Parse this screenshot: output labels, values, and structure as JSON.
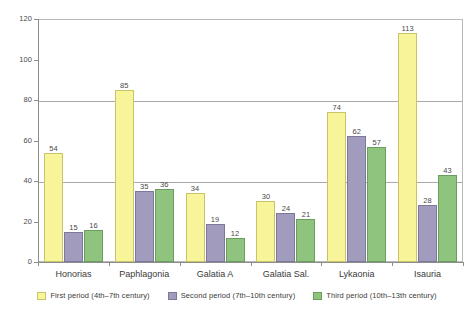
{
  "chart_data": {
    "type": "bar",
    "title": "",
    "subtitle": "",
    "xlabel": "",
    "ylabel": "",
    "ylim": [
      0,
      120
    ],
    "y_ticks": [
      0,
      20,
      40,
      60,
      80,
      100,
      120
    ],
    "gridlines": [
      40,
      80,
      120
    ],
    "grid": true,
    "legend_position": "bottom",
    "categories": [
      "Honorias",
      "Paphlagonia",
      "Galatia A",
      "Galatia Sal.",
      "Lykaonia",
      "Isauria"
    ],
    "series": [
      {
        "name": "First period (4th–7th century)",
        "color": "#f7f49a",
        "values": [
          54,
          85,
          34,
          30,
          74,
          113
        ]
      },
      {
        "name": "Second period (7th–10th century)",
        "color": "#a19cbd",
        "values": [
          15,
          35,
          19,
          24,
          62,
          28
        ]
      },
      {
        "name": "Third period (10th–13th century)",
        "color": "#8fc47e",
        "values": [
          16,
          36,
          12,
          21,
          57,
          43
        ]
      }
    ]
  },
  "axis": {
    "y_tick_labels": [
      "0",
      "20",
      "40",
      "60",
      "80",
      "100",
      "120"
    ]
  },
  "legend": {
    "items": [
      {
        "label": "First period (4th–7th century)"
      },
      {
        "label": "Second period (7th–10th century)"
      },
      {
        "label": "Third period (10th–13th century)"
      }
    ]
  }
}
